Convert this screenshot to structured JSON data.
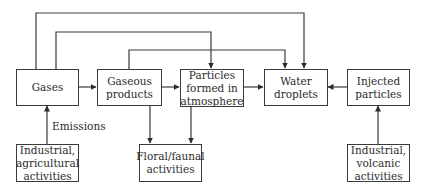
{
  "diagram": {
    "nodes": [
      {
        "id": "gases",
        "label": "Gases"
      },
      {
        "id": "gaseous_products",
        "label": "Gaseous\nproducts"
      },
      {
        "id": "particles_formed",
        "label": "Particles\nformed in\natmosphere"
      },
      {
        "id": "water_droplets",
        "label": "Water\ndroplets"
      },
      {
        "id": "injected_particles",
        "label": "Injected\nparticles"
      },
      {
        "id": "industrial_agricultural",
        "label": "Industrial,\nagricultural\nactivities"
      },
      {
        "id": "floral_faunal",
        "label": "Floral/faunal\nactivities"
      },
      {
        "id": "industrial_volcanic",
        "label": "Industrial,\nvolcanic\nactivities"
      }
    ],
    "edge_labels": {
      "emissions": "Emissions"
    },
    "edges": [
      {
        "from": "industrial_agricultural",
        "to": "gases",
        "label": "Emissions"
      },
      {
        "from": "gases",
        "to": "gaseous_products"
      },
      {
        "from": "gases",
        "to": "particles_formed"
      },
      {
        "from": "gases",
        "to": "water_droplets"
      },
      {
        "from": "gaseous_products",
        "to": "particles_formed"
      },
      {
        "from": "gaseous_products",
        "to": "water_droplets"
      },
      {
        "from": "gaseous_products",
        "to": "floral_faunal"
      },
      {
        "from": "particles_formed",
        "to": "water_droplets"
      },
      {
        "from": "particles_formed",
        "to": "floral_faunal"
      },
      {
        "from": "injected_particles",
        "to": "water_droplets"
      },
      {
        "from": "industrial_volcanic",
        "to": "injected_particles"
      }
    ]
  }
}
